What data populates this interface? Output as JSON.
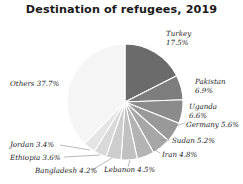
{
  "chart_data": {
    "type": "pie",
    "title": "Destination of refugees, 2019",
    "xlabel": "",
    "ylabel": "",
    "legend": "none",
    "grid": false,
    "labels_show_percent": true,
    "categories": [
      "Turkey",
      "Pakistan",
      "Uganda",
      "Germany",
      "Sudan",
      "Iran",
      "Lebanon",
      "Bangladesh",
      "Ethiopia",
      "Jordan",
      "Others"
    ],
    "values": [
      17.5,
      6.9,
      6.6,
      5.6,
      5.2,
      4.8,
      4.5,
      4.2,
      3.6,
      3.4,
      37.7
    ],
    "slices": [
      {
        "name": "Turkey",
        "value": 17.5,
        "label": "Turkey",
        "value_label": "17.5%",
        "color": "#6b6b6b"
      },
      {
        "name": "Pakistan",
        "value": 6.9,
        "label": "Pakistan",
        "value_label": "6.9%",
        "color": "#7d7d7d"
      },
      {
        "name": "Uganda",
        "value": 6.6,
        "label": "Uganda",
        "value_label": "6.6%",
        "color": "#8b8b8b"
      },
      {
        "name": "Germany",
        "value": 5.6,
        "label": "Germany 5.6%",
        "value_label": "5.6%",
        "color": "#999999"
      },
      {
        "name": "Sudan",
        "value": 5.2,
        "label": "Sudan 5.2%",
        "value_label": "5.2%",
        "color": "#a7a7a7"
      },
      {
        "name": "Iran",
        "value": 4.8,
        "label": "Iran 4.8%",
        "value_label": "4.8%",
        "color": "#b4b4b4"
      },
      {
        "name": "Lebanon",
        "value": 4.5,
        "label": "Lebanon 4.5%",
        "value_label": "4.5%",
        "color": "#c1c1c1"
      },
      {
        "name": "Bangladesh",
        "value": 4.2,
        "label": "Bangladesh 4.2%",
        "value_label": "4.2%",
        "color": "#cdcdcd"
      },
      {
        "name": "Ethiopia",
        "value": 3.6,
        "label": "Ethiopia 3.6%",
        "value_label": "3.6%",
        "color": "#d9d9d9"
      },
      {
        "name": "Jordan",
        "value": 3.4,
        "label": "Jordan 3.4%",
        "value_label": "3.4%",
        "color": "#e4e4e4"
      },
      {
        "name": "Others",
        "value": 37.7,
        "label": "Others 37.7%",
        "value_label": "37.7%",
        "color": "#f5f5f5"
      }
    ],
    "total": 100.0,
    "background_color": "#ffffff",
    "title_color": "#1b1b1b",
    "label_color": "#1d1d1d",
    "leader_line_color": "#8c8c8c"
  },
  "labels": {
    "turkey_line1": "Turkey",
    "turkey_line2": "17.5%",
    "pakistan_line1": "Pakistan",
    "pakistan_line2": "6.9%",
    "uganda_line1": "Uganda",
    "uganda_line2": "6.6%",
    "germany": "Germany 5.6%",
    "sudan": "Sudan 5.2%",
    "iran": "Iran 4.8%",
    "lebanon": "Lebanon 4.5%",
    "bangladesh": "Bangladesh 4.2%",
    "ethiopia": "Ethiopia 3.6%",
    "jordan": "Jordan 3.4%",
    "others": "Others 37.7%"
  }
}
